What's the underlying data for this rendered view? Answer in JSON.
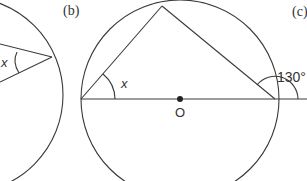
{
  "figure": {
    "panels": [
      {
        "id": "a",
        "label": "",
        "angle_label": "x"
      },
      {
        "id": "b",
        "label": "(b)",
        "angle_label": "x",
        "center_label": "O"
      },
      {
        "id": "c",
        "label": "(c)",
        "angle_label": "130°"
      }
    ]
  }
}
